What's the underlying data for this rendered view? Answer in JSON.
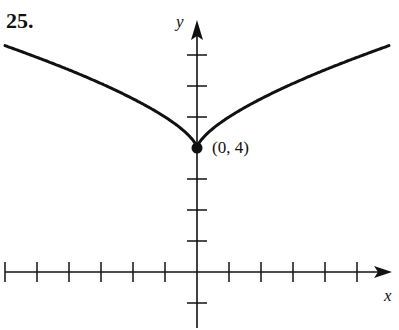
{
  "problem_number": "25.",
  "chart_data": {
    "type": "line",
    "title": "",
    "xlabel": "x",
    "ylabel": "y",
    "function": "y = x^(2/3) + 4",
    "x_ticks": [
      -6,
      -5,
      -4,
      -3,
      -2,
      -1,
      1,
      2,
      3,
      4,
      5
    ],
    "y_ticks": [
      -1,
      1,
      2,
      3,
      4,
      5,
      6,
      7
    ],
    "xlim": [
      -6.2,
      6.0
    ],
    "ylim": [
      -1.8,
      8.1
    ],
    "grid": false,
    "series": [
      {
        "name": "curve",
        "x": [
          -6,
          -5,
          -4,
          -3,
          -2,
          -1,
          -0.5,
          0,
          0.5,
          1,
          2,
          3,
          4,
          5,
          6
        ],
        "y": [
          7.3,
          6.92,
          6.52,
          6.08,
          5.59,
          5.0,
          4.63,
          4.0,
          4.63,
          5.0,
          5.59,
          6.08,
          6.52,
          6.92,
          7.3
        ]
      }
    ],
    "annotations": [
      {
        "point": [
          0,
          4
        ],
        "label": "(0, 4)",
        "marker": "filled-circle"
      }
    ]
  },
  "labels": {
    "x_axis": "x",
    "y_axis": "y",
    "point": "(0, 4)"
  }
}
